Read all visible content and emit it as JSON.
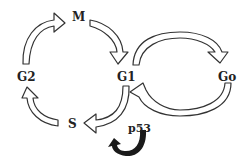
{
  "diagram": {
    "nodes": [
      {
        "id": "M",
        "label": "M"
      },
      {
        "id": "G1",
        "label": "G1"
      },
      {
        "id": "Go",
        "label": "Go"
      },
      {
        "id": "S",
        "label": "S"
      },
      {
        "id": "G2",
        "label": "G2"
      }
    ],
    "edges": [
      {
        "from": "M",
        "to": "G1"
      },
      {
        "from": "G1",
        "to": "S"
      },
      {
        "from": "S",
        "to": "G2"
      },
      {
        "from": "G2",
        "to": "M"
      },
      {
        "from": "G1",
        "to": "Go"
      },
      {
        "from": "Go",
        "to": "G1"
      }
    ],
    "regulator": {
      "label": "p53",
      "acts_on": "G1-S"
    },
    "colors": {
      "outline": "#333333",
      "fill": "#ffffff",
      "regulator_arrow": "#1a1a1a"
    }
  }
}
